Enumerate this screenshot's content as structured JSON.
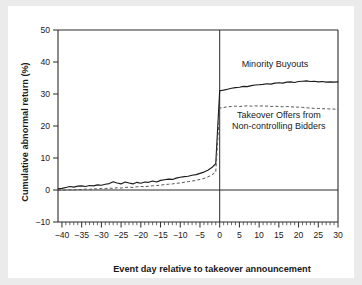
{
  "chart_data": {
    "type": "line",
    "title": "",
    "xlabel": "Event day relative to takeover announcement",
    "ylabel": "Cumulative abnormal return (%)",
    "xlim": [
      -41,
      30
    ],
    "ylim": [
      -10,
      50
    ],
    "xticks": [
      -40,
      -35,
      -30,
      -25,
      -20,
      -15,
      -10,
      -5,
      0,
      5,
      10,
      15,
      20,
      25,
      30
    ],
    "xticklabels": [
      "−40",
      "−35",
      "−30",
      "−25",
      "−20",
      "−15",
      "−10",
      "−5",
      "0",
      "5",
      "10",
      "15",
      "20",
      "25",
      "30"
    ],
    "yticks": [
      -10,
      0,
      10,
      20,
      30,
      40,
      50
    ],
    "yticklabels": [
      "−10",
      "0",
      "10",
      "20",
      "30",
      "40",
      "50"
    ],
    "grid": false,
    "legend_position": "inline-annotations",
    "reference_lines": [
      {
        "name": "zero-return",
        "axis": "y",
        "value": 0
      },
      {
        "name": "announcement-day",
        "axis": "x",
        "value": 0
      }
    ],
    "annotations": [
      {
        "name": "minority-buyouts-label",
        "text": "Minority Buyouts",
        "x": 14,
        "y": 38.5
      },
      {
        "name": "takeover-offers-label-line1",
        "text": "Takeover Offers from",
        "x": 15,
        "y": 22.5
      },
      {
        "name": "takeover-offers-label-line2",
        "text": "Non-controlling Bidders",
        "x": 15,
        "y": 19.2
      }
    ],
    "x": [
      -41,
      -40,
      -39,
      -38,
      -37,
      -36,
      -35,
      -34,
      -33,
      -32,
      -31,
      -30,
      -29,
      -28,
      -27,
      -26,
      -25,
      -24,
      -23,
      -22,
      -21,
      -20,
      -19,
      -18,
      -17,
      -16,
      -15,
      -14,
      -13,
      -12,
      -11,
      -10,
      -9,
      -8,
      -7,
      -6,
      -5,
      -4,
      -3,
      -2,
      -1,
      0,
      1,
      2,
      3,
      4,
      5,
      6,
      7,
      8,
      9,
      10,
      11,
      12,
      13,
      14,
      15,
      16,
      17,
      18,
      19,
      20,
      21,
      22,
      23,
      24,
      25,
      26,
      27,
      28,
      29,
      30
    ],
    "series": [
      {
        "name": "Minority Buyouts",
        "style": "solid",
        "color": "#1a1a1a",
        "values": [
          0.4,
          0.5,
          0.8,
          1.1,
          0.9,
          1.2,
          1.3,
          1.1,
          1.4,
          1.3,
          1.6,
          1.5,
          1.8,
          2.0,
          2.6,
          2.2,
          1.9,
          2.5,
          2.2,
          1.9,
          2.4,
          2.1,
          2.5,
          2.4,
          2.8,
          2.5,
          3.0,
          3.2,
          3.4,
          3.3,
          3.7,
          4.0,
          4.2,
          4.3,
          4.6,
          4.8,
          5.2,
          5.6,
          6.2,
          7.0,
          8.2,
          31.0,
          31.2,
          31.5,
          31.8,
          32.0,
          32.1,
          32.4,
          32.3,
          32.6,
          32.8,
          32.9,
          33.0,
          33.2,
          33.1,
          33.4,
          33.5,
          33.4,
          33.7,
          33.8,
          33.6,
          33.9,
          34.0,
          34.1,
          33.9,
          34.0,
          33.8,
          33.9,
          33.7,
          33.8,
          33.7,
          33.8
        ]
      },
      {
        "name": "Takeover Offers from Non-controlling Bidders",
        "style": "dashed",
        "color": "#555555",
        "values": [
          0.0,
          -0.1,
          0.0,
          0.1,
          0.0,
          0.2,
          0.1,
          0.3,
          0.2,
          0.4,
          0.3,
          0.5,
          0.4,
          0.6,
          0.5,
          0.7,
          0.6,
          0.8,
          0.9,
          0.8,
          1.0,
          1.1,
          1.0,
          1.2,
          1.3,
          1.4,
          1.5,
          1.7,
          1.8,
          1.9,
          2.1,
          2.2,
          2.4,
          2.6,
          2.8,
          3.0,
          3.3,
          3.6,
          4.1,
          4.7,
          5.6,
          25.6,
          25.8,
          26.0,
          26.1,
          26.2,
          26.1,
          26.2,
          26.3,
          26.2,
          26.3,
          26.2,
          26.3,
          26.2,
          26.1,
          26.2,
          26.1,
          26.0,
          26.1,
          26.0,
          25.9,
          25.9,
          25.8,
          25.7,
          25.6,
          25.5,
          25.5,
          25.4,
          25.4,
          25.3,
          25.3,
          25.2
        ]
      }
    ]
  }
}
